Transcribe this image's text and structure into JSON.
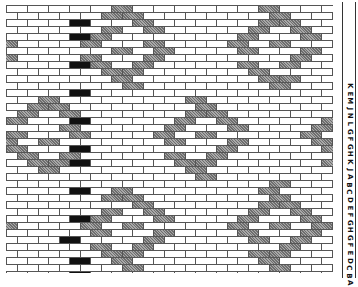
{
  "figure": {
    "type": "brick-pattern weaving draft",
    "row_height": 7,
    "brick_width": 21,
    "rows": 38,
    "colors": {
      "mortar": "#555555",
      "plain": "#ffffff",
      "gray": "#8a8a8a",
      "black": "#111111"
    },
    "diamonds": [
      {
        "cx": 120,
        "cy": 42,
        "r": 38
      },
      {
        "cx": 270,
        "cy": 42,
        "r": 38
      },
      {
        "cx": 40,
        "cy": 132,
        "r": 38
      },
      {
        "cx": 195,
        "cy": 132,
        "r": 38
      },
      {
        "cx": 120,
        "cy": 222,
        "r": 38
      },
      {
        "cx": 270,
        "cy": 222,
        "r": 38
      },
      {
        "cx": -35,
        "cy": 42,
        "r": 38
      },
      {
        "cx": -35,
        "cy": 222,
        "r": 38
      },
      {
        "cx": 345,
        "cy": 132,
        "r": 38
      }
    ],
    "black_column_x": 65,
    "black_rows": [
      2,
      4,
      8,
      12,
      16,
      20,
      22,
      26,
      30,
      33,
      36,
      38
    ]
  },
  "legend": {
    "letters": [
      "K",
      "E",
      "M",
      "J",
      "N",
      "L",
      "G",
      "F",
      "G",
      "H",
      "K",
      "J",
      "A",
      "B",
      "C",
      "D",
      "E",
      "F",
      "G",
      "H",
      "G",
      "F",
      "E",
      "D",
      "C",
      "B",
      "A"
    ]
  }
}
